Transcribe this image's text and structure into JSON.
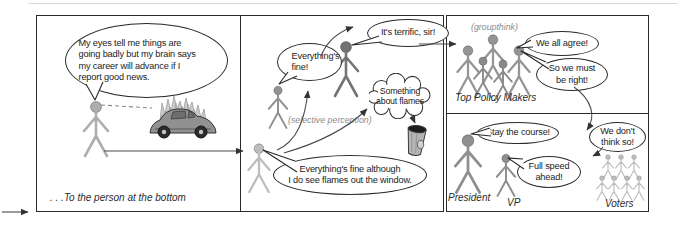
{
  "panel1": {
    "bubble_lines": [
      "My eyes tell me things are",
      "going badly but my brain says",
      "my career will advance if I",
      "report good news."
    ],
    "caption": ". . .To the person at the bottom"
  },
  "panel2": {
    "label_selective": "(selective perception)",
    "bubble_bottom_lines": [
      "Everything's fine although",
      "I do see flames out the window."
    ],
    "bubble_mid_lines": [
      "Everything's",
      "fine!"
    ],
    "bubble_top": "It's terrific, sir!",
    "cloud_lines": [
      "Something",
      "about flames"
    ]
  },
  "panel3": {
    "label_groupthink": "(groupthink)",
    "label_group": "Top Policy Makers",
    "bubble_agree": "We all agree!",
    "bubble_right_lines": [
      "So we must",
      "be right!"
    ]
  },
  "panel4": {
    "label_president": "President",
    "label_vp": "VP",
    "label_voters": "Voters",
    "bubble_president": "Stay the course!",
    "bubble_vp_lines": [
      "Full speed",
      "ahead!"
    ],
    "bubble_voters_lines": [
      "We don't",
      "think so!"
    ]
  },
  "icons": [
    "burning-car-icon",
    "trash-can-icon",
    "thought-cloud",
    "stick-figure"
  ],
  "colors": {
    "line": "#2a2a2a",
    "arrow": "#4a4a4a",
    "figure_light": "#b5b5b5",
    "figure_mid": "#8f8f8f",
    "figure_dark": "#6f6f6f",
    "label_gray": "#8c8c8c"
  }
}
